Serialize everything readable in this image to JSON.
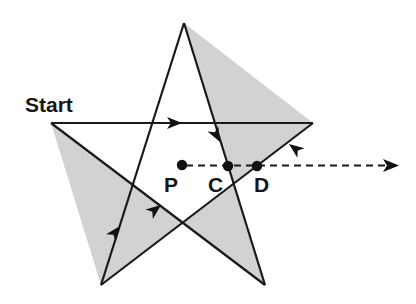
{
  "figure": {
    "name": "pentagram-light-path-diagram",
    "background_color": "#ffffff",
    "width": 416,
    "height": 304
  },
  "style": {
    "star_fill": "#d2d2d2",
    "stroke_color": "#1a1a1a",
    "stroke_width": 2.2,
    "dashed_stroke_color": "#1a1a1a",
    "dash_pattern": "7,5",
    "dot_color": "#111111",
    "dot_radius": 5,
    "label_color": "#161616"
  },
  "labels": {
    "start": "Start",
    "point_p": "P",
    "point_c": "C",
    "point_d": "D"
  },
  "label_positions": {
    "start": {
      "x": 25,
      "y": 112
    },
    "point_p": {
      "x": 164,
      "y": 192
    },
    "point_c": {
      "x": 208,
      "y": 192
    },
    "point_d": {
      "x": 254,
      "y": 192
    }
  },
  "star": {
    "type": "pentagram",
    "center": {
      "x": 183,
      "y": 158
    },
    "vertices": [
      {
        "name": "top",
        "x": 184,
        "y": 23
      },
      {
        "name": "right",
        "x": 313,
        "y": 123
      },
      {
        "name": "bottom-right",
        "x": 265,
        "y": 285
      },
      {
        "name": "bottom-left",
        "x": 101,
        "y": 285
      },
      {
        "name": "left",
        "x": 51,
        "y": 123
      }
    ],
    "polygon_points": "184,23 313,123 101,285 51,123 265,285"
  },
  "marked_points": [
    {
      "label": "P",
      "x": 182,
      "y": 165
    },
    {
      "label": "C",
      "x": 228,
      "y": 166
    },
    {
      "label": "D",
      "x": 257,
      "y": 166
    }
  ],
  "dashed_ray": {
    "from": {
      "x": 182,
      "y": 165
    },
    "to": {
      "x": 398,
      "y": 166
    },
    "has_arrowhead": true,
    "direction": "right"
  },
  "path_arrowheads": [
    {
      "id": "arrow-top-horizontal",
      "x": 182,
      "y": 123,
      "angle_deg": 0,
      "description": "rightward along horizontal top chord"
    },
    {
      "id": "arrow-upper-right",
      "x": 219,
      "y": 141,
      "angle_deg": 62,
      "description": "down-right along top-to-bottom-left chord"
    },
    {
      "id": "arrow-right-inward",
      "x": 291,
      "y": 143,
      "angle_deg": 210,
      "description": "down-left from right vertex toward bottom-left"
    },
    {
      "id": "arrow-lower-inner",
      "x": 160,
      "y": 206,
      "angle_deg": -45,
      "description": "up-right along bottom-right-to-top chord"
    },
    {
      "id": "arrow-lower-left",
      "x": 119,
      "y": 227,
      "angle_deg": -58,
      "description": "up-right along bottom-left-to-right chord"
    }
  ]
}
